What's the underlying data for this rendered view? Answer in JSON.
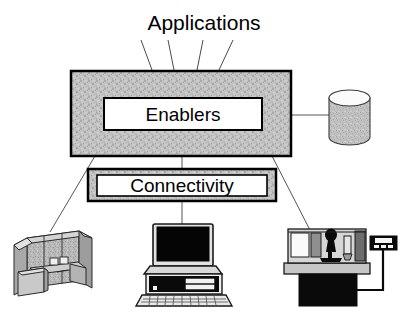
{
  "diagram": {
    "title": "Applications",
    "blocks": [
      {
        "id": "enablers",
        "label": "Enablers"
      },
      {
        "id": "connectivity",
        "label": "Connectivity"
      }
    ],
    "nodes": [
      {
        "id": "database",
        "label": "database-cylinder-icon"
      },
      {
        "id": "office",
        "label": "office-cubicle-icon"
      },
      {
        "id": "computer",
        "label": "desktop-computer-icon"
      },
      {
        "id": "machine",
        "label": "cnc-machine-tool-icon"
      },
      {
        "id": "controller",
        "label": "machine-controller-icon"
      }
    ],
    "connector_count_applications": 4,
    "colors": {
      "outline": "#000000",
      "fill_gray": "#bdbdbd",
      "fill_white": "#ffffff",
      "fill_black": "#000000",
      "connector": "#555555"
    }
  }
}
